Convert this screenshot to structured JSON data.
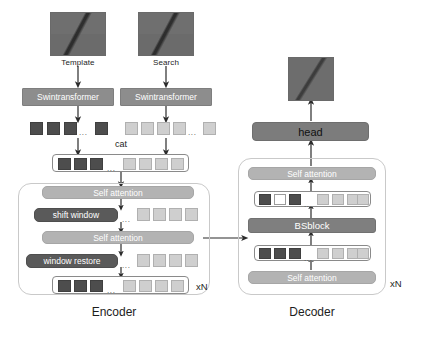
{
  "diagram": {
    "title_hidden": "",
    "inputs": {
      "template_label": "Template",
      "search_label": "Search"
    },
    "backbone": {
      "template_encoder_label": "Swintransformer",
      "search_encoder_label": "Swintransformer"
    },
    "concat_label": "cat",
    "encoder": {
      "name": "Encoder",
      "repeat": "xN",
      "blocks": [
        {
          "label": "Self attention",
          "style": "light"
        },
        {
          "label": "shift window",
          "style": "dark"
        },
        {
          "label": "Self attention",
          "style": "light"
        },
        {
          "label": "window restore",
          "style": "dark"
        }
      ]
    },
    "decoder": {
      "name": "Decoder",
      "repeat": "xN",
      "blocks": [
        {
          "label": "Self attention",
          "style": "light"
        },
        {
          "label": "BSblock",
          "style": "mid"
        },
        {
          "label": "Self attention",
          "style": "light"
        }
      ]
    },
    "head": {
      "label": "head"
    },
    "output": {
      "label": ""
    },
    "dots": "...",
    "token_rows": {
      "template_tokens": {
        "dark": 3,
        "tail_dark": 1
      },
      "search_tokens": {
        "light": 4,
        "tail_light": 1
      },
      "cat_tokens": {
        "dark": 3,
        "light": 4
      },
      "encoder_shift_tokens": {
        "light": 4
      },
      "encoder_restore_tokens": {
        "light": 4
      },
      "encoder_out_tokens": {
        "dark": 3,
        "light": 4
      },
      "decoder_upper_tokens": {
        "dark1": 1,
        "white": 1,
        "dark2": 1,
        "light": 4
      },
      "decoder_lower_tokens": {
        "dark": 3,
        "light": 4
      }
    },
    "colors": {
      "token_dark": "#4d4d4d",
      "token_light": "#cfcfcf",
      "token_white": "#ffffff",
      "block_light": "#b3b3b3",
      "block_dark": "#5a5a5a",
      "block_mid": "#7f7f7f",
      "backbone": "#8d8d8d",
      "head": "#7c7c7c",
      "panel_border": "#c9c9c9",
      "arrow": "#2b2b2b",
      "text_dark": "#1d1d1d"
    }
  }
}
